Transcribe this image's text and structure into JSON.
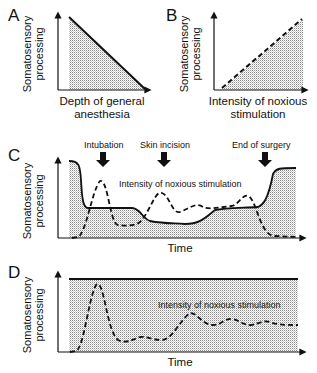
{
  "panels": [
    {
      "letter": "A",
      "ylabel_line1": "Somatosensory",
      "ylabel_line2": "processing",
      "xlabel_line1": "Depth of general",
      "xlabel_line2": "anesthesia",
      "curve": "solid line decreasing linearly"
    },
    {
      "letter": "B",
      "ylabel_line1": "Somatosensory",
      "ylabel_line2": "processing",
      "xlabel_line1": "Intensity of noxious",
      "xlabel_line2": "stimulation",
      "curve": "dashed line increasing linearly"
    },
    {
      "letter": "C",
      "ylabel_line1": "Somatosensory",
      "ylabel_line2": "processing",
      "xlabel": "Time",
      "annotation": "Intensity of noxious stimulation",
      "events": [
        "Intubation",
        "Skin incision",
        "End of surgery"
      ]
    },
    {
      "letter": "D",
      "ylabel_line1": "Somatosensory",
      "ylabel_line2": "processing",
      "xlabel": "Time",
      "annotation": "Intensity of noxious stimulation"
    }
  ],
  "colors": {
    "line": "#111111",
    "shade": "#bdbdbd",
    "background": "#ffffff"
  }
}
